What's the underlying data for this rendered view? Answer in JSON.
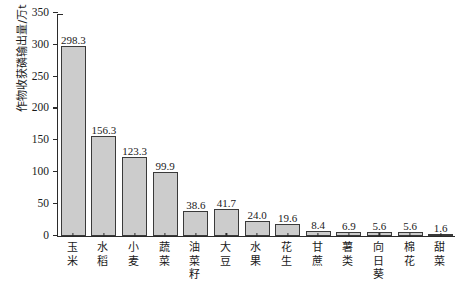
{
  "chart_data": {
    "type": "bar",
    "title": "",
    "subtitle": "",
    "xlabel": "",
    "ylabel": "作物收获磷输出量/万t",
    "ylim": [
      0,
      350
    ],
    "yticks": [
      0,
      50,
      100,
      150,
      200,
      250,
      300,
      350
    ],
    "ytick_labels": [
      "0",
      "50",
      "100",
      "150",
      "200",
      "250",
      "300",
      "350"
    ],
    "grid": false,
    "legend": null,
    "categories": [
      "玉米",
      "水稻",
      "小麦",
      "蔬菜",
      "油菜籽",
      "大豆",
      "水果",
      "花生",
      "甘蔗",
      "薯类",
      "向日葵",
      "棉花",
      "甜菜"
    ],
    "values": [
      298.3,
      156.3,
      123.3,
      99.9,
      38.6,
      41.7,
      24.0,
      19.6,
      8.4,
      6.9,
      5.6,
      5.6,
      1.6
    ],
    "value_labels": [
      "298.3",
      "156.3",
      "123.3",
      "99.9",
      "38.6",
      "41.7",
      "24.0",
      "19.6",
      "8.4",
      "6.9",
      "5.6",
      "5.6",
      "1.6"
    ],
    "bar_fill_color": "#cccccc",
    "bar_edge_color": "#3a3a3a",
    "axis_color": "#2b2b2b",
    "background_color": "#ffffff"
  }
}
